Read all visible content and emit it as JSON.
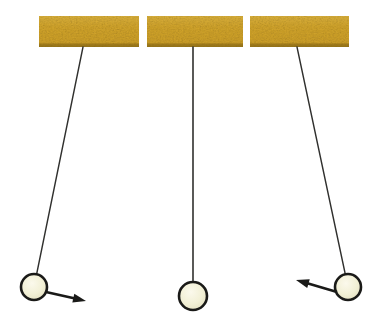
{
  "figure": {
    "width": 390,
    "height": 329,
    "background_color": "#FFFFFF"
  },
  "colors": {
    "bar_fill": "#D4A62C",
    "bar_fill_light": "#E0B848",
    "bar_fill_dark": "#C29A22",
    "bar_edge_shadow": "#8A6B18",
    "string": "#30302E",
    "bob_fill": "#F2F0D6",
    "bob_fill_highlight": "#FAF8E8",
    "bob_stroke": "#1A1A18",
    "arrow": "#1A1A18"
  },
  "supports": [
    {
      "label": "left-support-bar",
      "x": 39,
      "y": 16,
      "width": 100,
      "height": 31
    },
    {
      "label": "middle-support-bar",
      "x": 147,
      "y": 16,
      "width": 96,
      "height": 31
    },
    {
      "label": "right-support-bar",
      "x": 250,
      "y": 16,
      "width": 99,
      "height": 31
    }
  ],
  "pendulums": [
    {
      "label": "left-pendulum",
      "state": "displaced-left",
      "pivot": {
        "x": 83,
        "y": 47
      },
      "bob": {
        "cx": 34,
        "cy": 287,
        "r": 13
      },
      "string_width": 1.4,
      "arrow": {
        "label": "left-velocity-arrow",
        "from": {
          "x": 46,
          "y": 292
        },
        "to": {
          "x": 86,
          "y": 301
        },
        "head_length": 13,
        "head_width": 9,
        "shaft_width": 2.6,
        "direction": "right-down"
      }
    },
    {
      "label": "middle-pendulum",
      "state": "at-rest-vertical",
      "pivot": {
        "x": 193,
        "y": 47
      },
      "bob": {
        "cx": 193,
        "cy": 296,
        "r": 14
      },
      "string_width": 1.6,
      "arrow": null
    },
    {
      "label": "right-pendulum",
      "state": "displaced-right",
      "pivot": {
        "x": 297,
        "y": 47
      },
      "bob": {
        "cx": 348,
        "cy": 287,
        "r": 13
      },
      "string_width": 1.4,
      "arrow": {
        "label": "right-velocity-arrow",
        "from": {
          "x": 337,
          "y": 292
        },
        "to": {
          "x": 296,
          "y": 280
        },
        "head_length": 13,
        "head_width": 9,
        "shaft_width": 2.6,
        "direction": "left-up"
      }
    }
  ]
}
